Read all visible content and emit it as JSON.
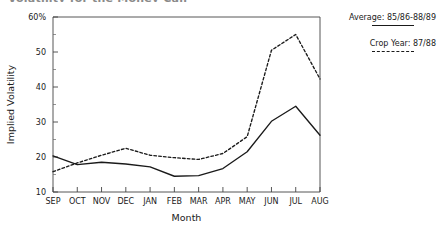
{
  "figure": {
    "clipped_title": "Volatility for the Money Call"
  },
  "legend": {
    "position": "right",
    "entries": [
      {
        "label": "Average: 85/86-88/89",
        "style": "solid"
      },
      {
        "label": "Crop Year: 87/88",
        "style": "dashed"
      }
    ]
  },
  "axes": {
    "y_top_label": "60%",
    "y_tick_labels": [
      "60%",
      "50",
      "40",
      "30",
      "20",
      "10"
    ],
    "y_title": "Implied Volatility",
    "x_title": "Month",
    "x_tick_labels": [
      "SEP",
      "OCT",
      "NOV",
      "DEC",
      "JAN",
      "FEB",
      "MAR",
      "APR",
      "MAY",
      "JUN",
      "JUL",
      "AUG"
    ]
  },
  "chart_data": {
    "type": "line",
    "title": "Volatility for the Money Call",
    "xlabel": "Month",
    "ylabel": "Implied Volatility",
    "categories": [
      "SEP",
      "OCT",
      "NOV",
      "DEC",
      "JAN",
      "FEB",
      "MAR",
      "APR",
      "MAY",
      "JUN",
      "JUL",
      "AUG"
    ],
    "series": [
      {
        "name": "Average: 85/86-88/89",
        "style": "solid",
        "color": "#1a1a1a",
        "values": [
          20.3,
          17.8,
          18.5,
          18.0,
          17.2,
          14.5,
          14.7,
          16.7,
          21.5,
          30.2,
          34.5,
          26.2
        ]
      },
      {
        "name": "Crop Year: 87/88",
        "style": "dashed",
        "color": "#1a1a1a",
        "values": [
          15.8,
          18.3,
          20.5,
          22.5,
          20.5,
          19.8,
          19.3,
          21.0,
          25.8,
          50.5,
          55.0,
          42.3
        ]
      }
    ],
    "ylim": [
      10,
      60
    ],
    "ytick_values": [
      10,
      20,
      30,
      40,
      50,
      60
    ],
    "yminor_values": [
      15,
      25,
      35,
      45,
      55
    ],
    "grid": false,
    "legend_position": "right"
  }
}
